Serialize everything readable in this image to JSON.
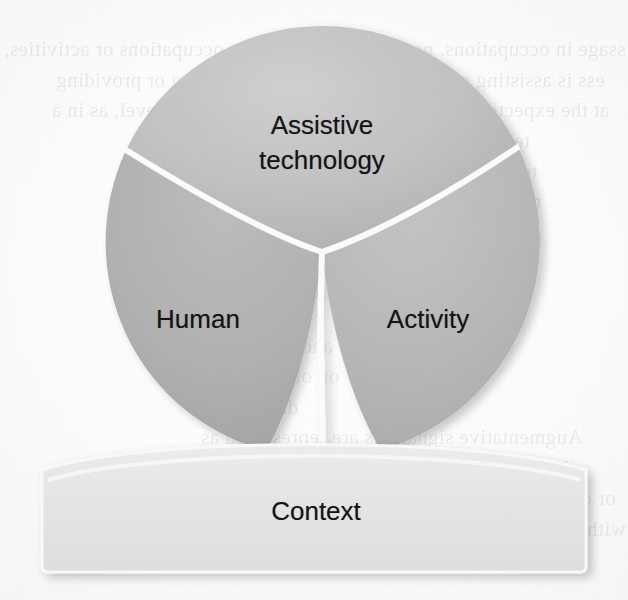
{
  "figure": {
    "type": "haat-model-diagram",
    "segments": [
      {
        "id": "assistive-technology",
        "label": "Assistive\ntechnology",
        "position": "top",
        "fill": "#b9b9b9"
      },
      {
        "id": "human",
        "label": "Human",
        "position": "bottom-left",
        "fill": "#b2b2b2"
      },
      {
        "id": "activity",
        "label": "Activity",
        "position": "bottom-right",
        "fill": "#b5b5b5"
      }
    ],
    "base": {
      "id": "context",
      "label": "Context",
      "fill": "#e3e3e3"
    },
    "colors": {
      "circle_top": "#c2c2c2",
      "circle_bottom_left": "#aeaeae",
      "circle_bottom_right": "#b6b6b6",
      "divider": "#fbfbfb",
      "context_fill": "#e4e4e4",
      "context_stroke": "#f7f7f7",
      "label_text": "#141414",
      "page_background": "#fdfdfd"
    }
  },
  "background_text": {
    "note": "faint mirrored bleed-through text from the reverse side of the scanned page",
    "left_upper": [
      "ssage in occupations or activities,",
      "ess is assisting or providing",
      "at the expected level, as in a",
      "technology devices",
      "to improve or main-",
      "tional capabilities of",
      "eek to match the",
      "personalised",
      "1988)."
    ],
    "right_upper": [
      "ssage in occupations. need for",
      "ess is assisting or providing",
      "at the expected level, as in a",
      "technology devices",
      "to improve or main-",
      "tional capabilities of",
      "eek to match the",
      "personalised",
      "1988)."
    ],
    "right_lower": [
      "The model",
      "and Family are",
      "on of the model",
      "discussion.",
      "Augmentative signatures are represented as",
      "the stick is identified relation with graphic",
      "or data. The more the stroke is visible to assess",
      "with the user, and a person assistive activities of",
      "and interpretation that a user than a person"
    ]
  }
}
